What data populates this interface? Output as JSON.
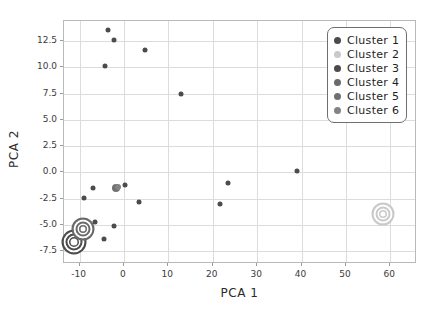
{
  "chart_data": {
    "type": "scatter",
    "title": "",
    "xlabel": "PCA 1",
    "ylabel": "PCA 2",
    "xlim": [
      -13.5,
      66.0
    ],
    "ylim": [
      -8.7,
      14.4
    ],
    "grid": true,
    "legend_position": "upper right",
    "xticks": [
      -10,
      0,
      10,
      20,
      30,
      40,
      50,
      60
    ],
    "xticklabels": [
      "-10",
      "0",
      "10",
      "20",
      "30",
      "40",
      "50",
      "60"
    ],
    "yticks": [
      12.5,
      10.0,
      7.5,
      5.0,
      2.5,
      0.0,
      -2.5,
      -5.0,
      -7.5
    ],
    "yticklabels": [
      "12.5",
      "10.0",
      "7.5",
      "5.0",
      "2.5",
      "0.0",
      "-2.5",
      "-5.0",
      "-7.5"
    ],
    "series": [
      {
        "name": "Cluster 1",
        "color": "#4b4b4b",
        "points": [
          {
            "x": -3.6,
            "y": 13.5,
            "size": 5
          },
          {
            "x": -2.3,
            "y": 12.6,
            "size": 5
          },
          {
            "x": 4.7,
            "y": 11.6,
            "size": 5
          },
          {
            "x": -4.2,
            "y": 10.1,
            "size": 5
          },
          {
            "x": 12.9,
            "y": 7.5,
            "size": 5
          },
          {
            "x": 39.0,
            "y": 0.1,
            "size": 5
          },
          {
            "x": 23.5,
            "y": -1.0,
            "size": 5
          },
          {
            "x": 0.2,
            "y": -1.2,
            "size": 5
          },
          {
            "x": -6.9,
            "y": -1.5,
            "size": 5
          },
          {
            "x": -9.0,
            "y": -2.4,
            "size": 5
          },
          {
            "x": 3.3,
            "y": -2.8,
            "size": 5
          },
          {
            "x": 21.6,
            "y": -3.0,
            "size": 5
          },
          {
            "x": -6.6,
            "y": -4.7,
            "size": 5
          },
          {
            "x": -2.2,
            "y": -5.1,
            "size": 5
          },
          {
            "x": -4.4,
            "y": -6.3,
            "size": 5
          }
        ]
      },
      {
        "name": "Cluster 2",
        "color": "#c9c9c9",
        "points": [
          {
            "x": 58.3,
            "y": -3.9,
            "size": 19
          }
        ]
      },
      {
        "name": "Cluster 3",
        "color": "#4b4b4b",
        "points": [
          {
            "x": -11.2,
            "y": -6.6,
            "size": 21
          }
        ]
      },
      {
        "name": "Cluster 4",
        "color": "#6a6a6a",
        "points": [
          {
            "x": -9.3,
            "y": -5.4,
            "size": 19
          }
        ]
      },
      {
        "name": "Cluster 5",
        "color": "#707070",
        "points": [
          {
            "x": -1.9,
            "y": -1.5,
            "size": 8
          }
        ]
      },
      {
        "name": "Cluster 6",
        "color": "#838383",
        "points": [
          {
            "x": -1.4,
            "y": -1.4,
            "size": 6
          }
        ]
      }
    ]
  },
  "legend": {
    "entries": [
      {
        "label": "Cluster 1",
        "color": "#4b4b4b"
      },
      {
        "label": "Cluster 2",
        "color": "#c9c9c9"
      },
      {
        "label": "Cluster 3",
        "color": "#4b4b4b"
      },
      {
        "label": "Cluster 4",
        "color": "#6a6a6a"
      },
      {
        "label": "Cluster 5",
        "color": "#707070"
      },
      {
        "label": "Cluster 6",
        "color": "#838383"
      }
    ]
  }
}
